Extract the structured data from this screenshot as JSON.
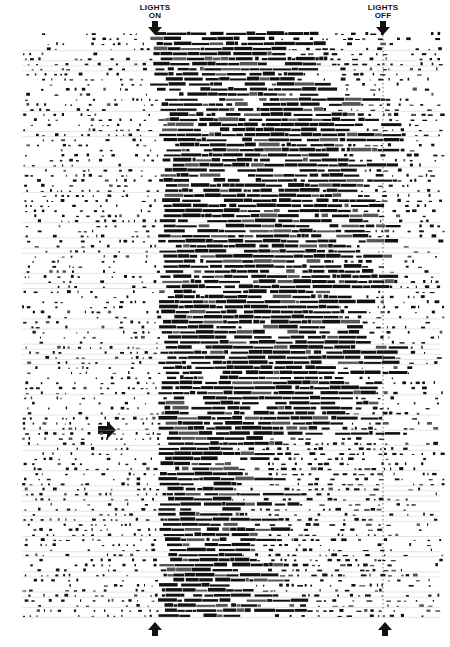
{
  "chart_data": {
    "type": "actogram",
    "title": "",
    "annotations": [
      {
        "text_line1": "LIGHTS",
        "text_line2": "ON",
        "x": 155,
        "position": "top",
        "arrow": "down"
      },
      {
        "text_line1": "LIGHTS",
        "text_line2": "OFF",
        "x": 383,
        "position": "top",
        "arrow": "down"
      },
      {
        "text": "",
        "x": 112,
        "y": 430,
        "arrow": "right"
      },
      {
        "text": "",
        "x": 155,
        "y": 630,
        "arrow": "up"
      },
      {
        "text": "",
        "x": 385,
        "y": 630,
        "arrow": "up"
      }
    ],
    "rows": 116,
    "row_start_y": 21,
    "row_end_y": 608,
    "x_range_px": [
      22,
      445
    ],
    "lights_on_x": 155,
    "lights_off_x": 383,
    "phases": [
      {
        "from_row": 0,
        "to_row": 12,
        "dense_start": 150,
        "dense_end": 300,
        "note": "activity onset near lights-on, extends toward lights-off in early rows"
      },
      {
        "from_row": 12,
        "to_row": 80,
        "dense_start": 158,
        "dense_end": 360,
        "note": "consolidated activity band after lights-on"
      },
      {
        "from_row": 80,
        "to_row": 116,
        "dense_start": 158,
        "dense_end": 260,
        "note": "activity onset anchored at lights-on, shorter bouts"
      }
    ],
    "xlabel": "",
    "ylabel": "",
    "grid": false,
    "legend": null
  }
}
